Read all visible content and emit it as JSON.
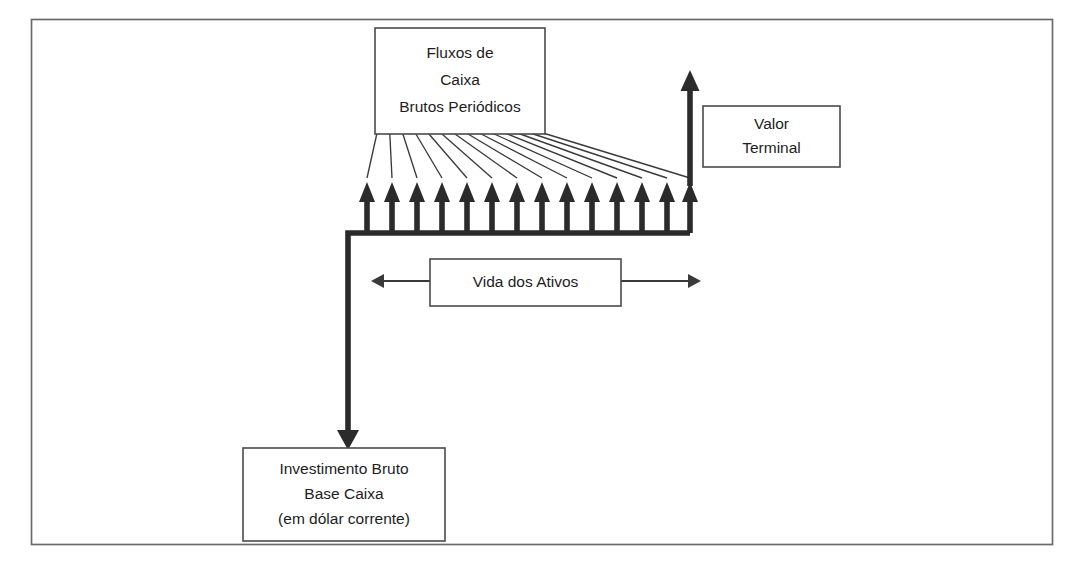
{
  "figure": {
    "type": "cash-flow-timeline-diagram",
    "language": "pt-BR",
    "background_color": "#ffffff",
    "line_color": "#2b2b2b",
    "frame_color": "#6b6b6b",
    "text_color": "#1d1d1d"
  },
  "frame": {
    "name": "outer-border",
    "x": 31,
    "y": 19,
    "width": 1022,
    "height": 526
  },
  "boxes": {
    "gross_cash_flows": {
      "lines": [
        "Fluxos de",
        "Caixa",
        "Brutos Periódicos"
      ],
      "line1": "Fluxos de",
      "line2": "Caixa",
      "line3": "Brutos Periódicos",
      "x": 375,
      "y": 28,
      "width": 170,
      "height": 106
    },
    "terminal_value": {
      "lines": [
        "Valor",
        "Terminal"
      ],
      "line1": "Valor",
      "line2": "Terminal",
      "x": 703,
      "y": 106,
      "width": 137,
      "height": 61
    },
    "asset_life": {
      "lines": [
        "Vida dos Ativos"
      ],
      "line1": "Vida dos Ativos",
      "x": 430,
      "y": 259,
      "width": 191,
      "height": 47
    },
    "gross_investment": {
      "lines": [
        "Investimento Bruto",
        "Base Caixa",
        "(em dólar corrente)"
      ],
      "line1": "Investimento Bruto",
      "line2": "Base Caixa",
      "line3": "(em dólar corrente)",
      "x": 243,
      "y": 448,
      "width": 202,
      "height": 93
    }
  },
  "timeline": {
    "baseline_y": 233,
    "baseline_x_start": 348,
    "baseline_x_end": 690,
    "periodic_arrow_count": 14,
    "periodic_arrow_tip_y": 182,
    "periodic_arrow_x_positions": [
      367,
      392,
      417,
      442,
      467,
      492,
      517,
      542,
      567,
      592,
      617,
      642,
      667,
      690
    ],
    "terminal_arrow": {
      "x": 690,
      "tip_y": 70,
      "base_y": 186
    },
    "investment_arrow": {
      "x": 348,
      "from_y": 233,
      "tip_y": 450
    }
  },
  "span_marker": {
    "name": "asset-life-span",
    "y": 281,
    "left_tip_x": 371,
    "right_tip_x": 701,
    "label": "Vida dos Ativos"
  },
  "fan": {
    "source_edge_y": 133,
    "source_x_start": 377,
    "source_x_end": 543,
    "target_y": 178,
    "line_count": 14
  }
}
